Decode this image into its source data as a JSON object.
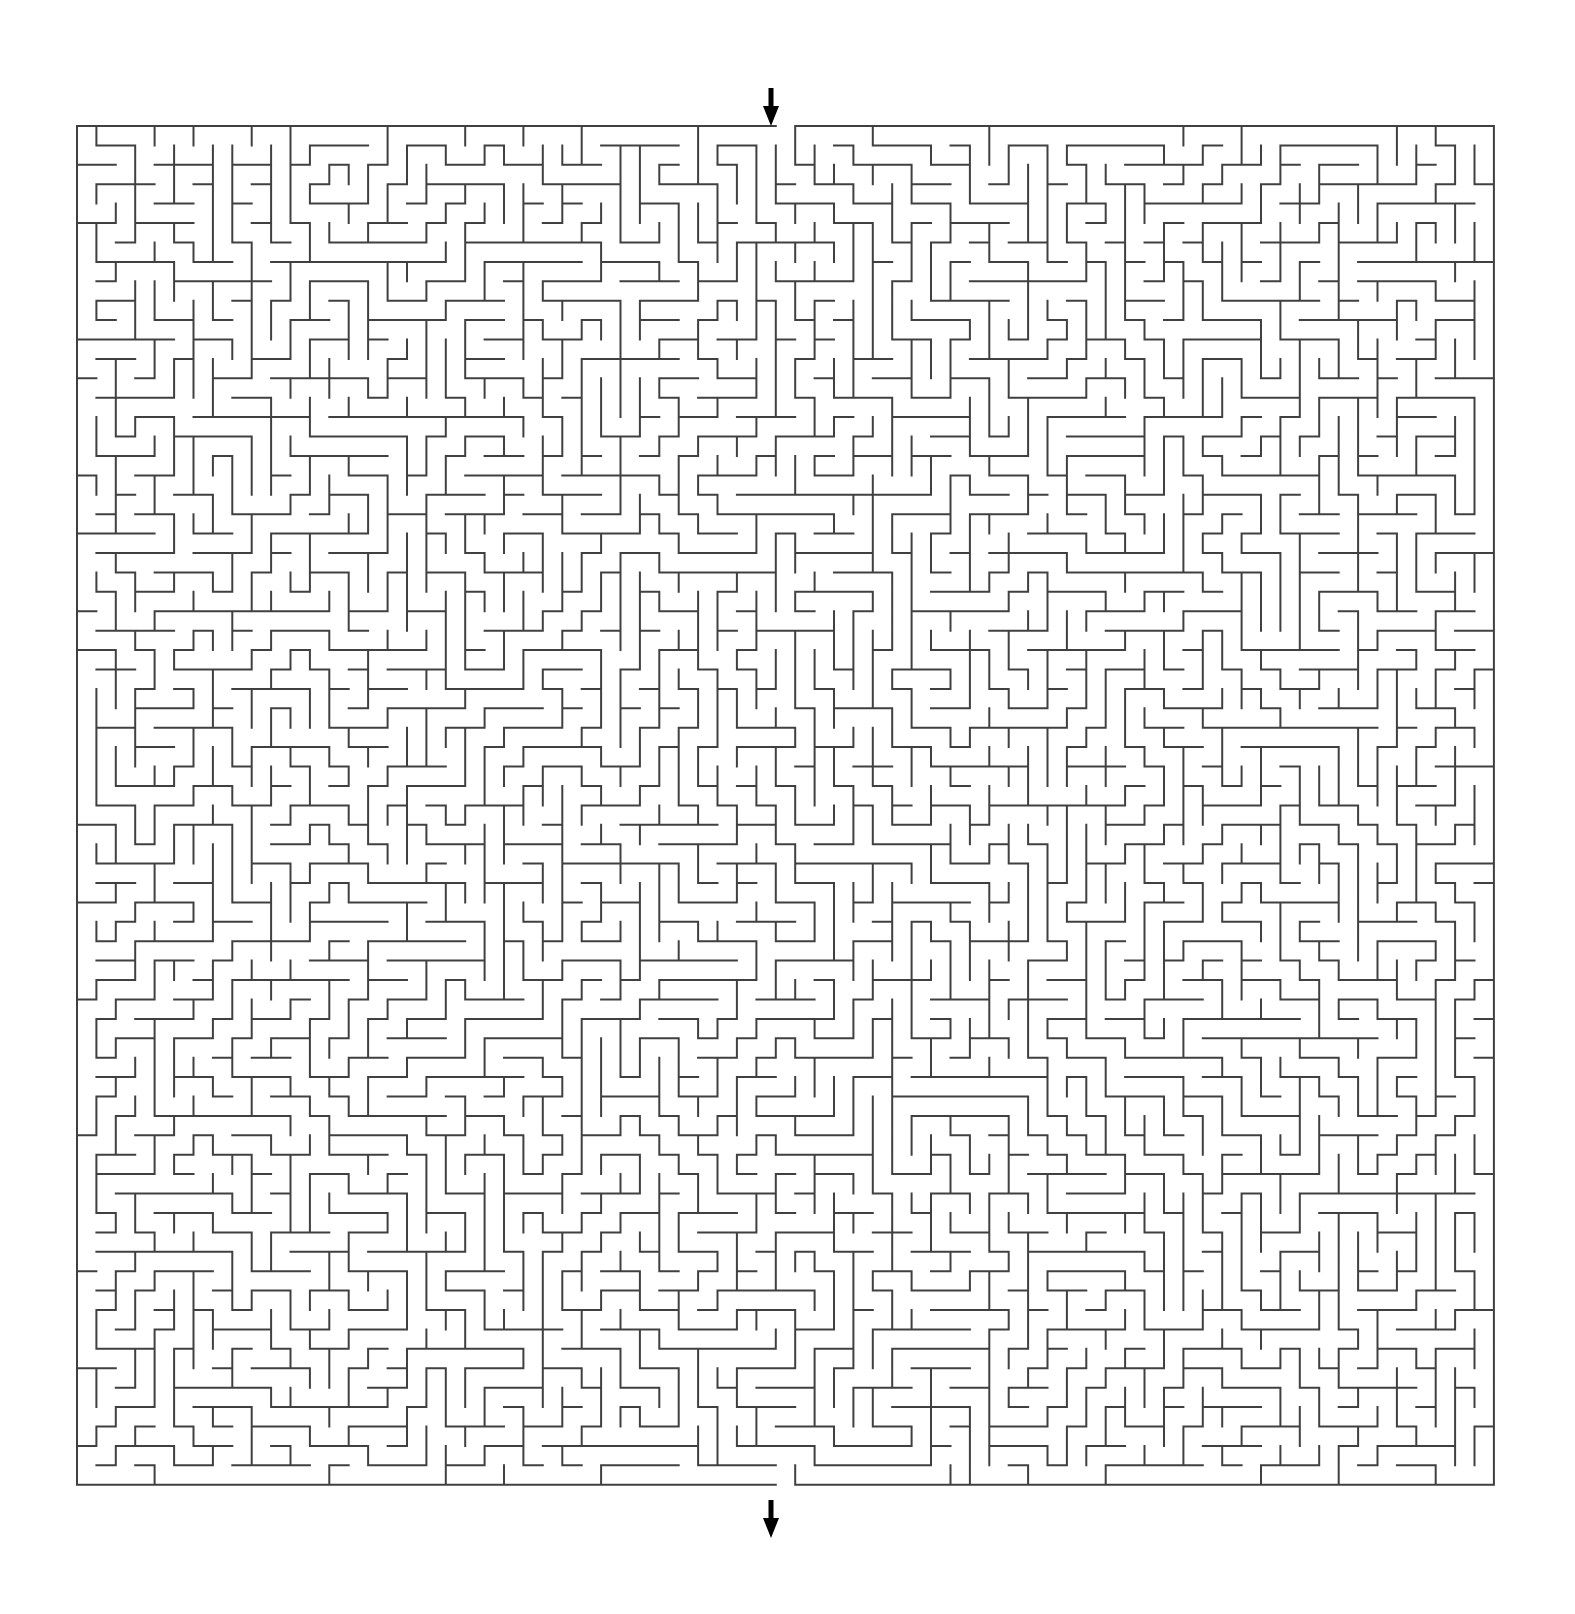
{
  "page": {
    "background_color": "#ffffff",
    "width": 1575,
    "height": 1614
  },
  "maze": {
    "type": "perfect-maze",
    "algorithm": "depth-first-search",
    "wall_color": "#404040",
    "wall_thickness": 2,
    "background_color": "#ffffff",
    "origin_x": 77,
    "origin_y": 126,
    "cell_size": 19.41,
    "columns": 73,
    "rows": 70,
    "width_px": 1417,
    "height_px": 1366,
    "seed": 20240917,
    "entrance": {
      "label": "entrance",
      "side": "top",
      "column": 36,
      "arrow_direction": "down",
      "arrow_color": "#000000",
      "arrow_x": 771,
      "arrow_y": 88,
      "arrow_length": 38
    },
    "exit": {
      "label": "exit",
      "side": "bottom",
      "column": 36,
      "arrow_direction": "down",
      "arrow_color": "#000000",
      "arrow_x": 771,
      "arrow_y": 1500,
      "arrow_length": 38
    }
  }
}
